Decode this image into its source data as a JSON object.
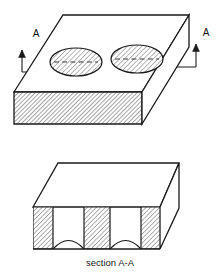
{
  "figure": {
    "title": "section A-A",
    "caption": "section A-A",
    "type": "isometric-engineering-drawing",
    "background_color": "#ffffff",
    "line_color": "#1a1a1a",
    "hatch_color": "#555555",
    "face_fill": "#ffffff"
  },
  "top_view": {
    "name": "isometric-block-with-holes",
    "cut_label_left": "A",
    "cut_label_right": "A",
    "holes": [
      {
        "name": "elliptical-hole-left",
        "cx": 76,
        "cy": 62,
        "rx": 26,
        "ry": 14,
        "hatched": true,
        "centerline": true
      },
      {
        "name": "elliptical-hole-right",
        "cx": 137,
        "cy": 59,
        "rx": 26,
        "ry": 14,
        "hatched": true,
        "centerline": true
      }
    ],
    "front_face_hatched": true,
    "side_face_hatched": false,
    "hole_count": 2
  },
  "section_view": {
    "name": "section-a-a-block",
    "pillars": 3,
    "arch_cutouts": 2,
    "pillars_hatched": true,
    "caption": "section A-A"
  },
  "labels": {
    "arrow_left": "A",
    "arrow_right": "A",
    "section_caption": "section A-A"
  }
}
